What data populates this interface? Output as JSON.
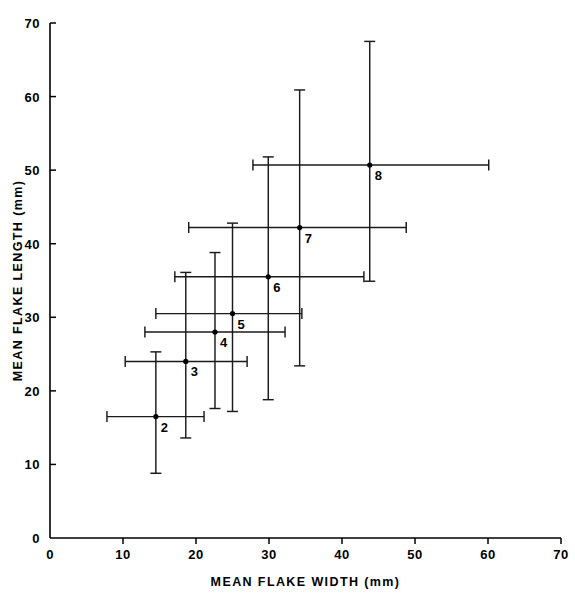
{
  "chart_data": {
    "type": "scatter",
    "title": "",
    "xlabel": "MEAN FLAKE WIDTH (mm)",
    "ylabel": "MEAN FLAKE LENGTH (mm)",
    "xlim": [
      0,
      70
    ],
    "ylim": [
      0,
      70
    ],
    "xticks": [
      0,
      10,
      20,
      30,
      40,
      50,
      60,
      70
    ],
    "yticks": [
      0,
      10,
      20,
      30,
      40,
      50,
      60,
      70
    ],
    "xtick_labels": [
      "0",
      "10",
      "20",
      "30",
      "40",
      "50",
      "60",
      "70"
    ],
    "ytick_labels": [
      "0",
      "10",
      "20",
      "30",
      "40",
      "50",
      "60",
      "70"
    ],
    "grid": false,
    "legend": false,
    "error_bars": "both",
    "marker_color": "#000000",
    "line_color": "#1a1a1a",
    "points": [
      {
        "label": "2",
        "x": 14.5,
        "y": 16.5,
        "x_low": 7.8,
        "x_high": 21.1,
        "y_low": 8.8,
        "y_high": 25.3
      },
      {
        "label": "3",
        "x": 18.6,
        "y": 24.0,
        "x_low": 10.3,
        "x_high": 27.0,
        "y_low": 13.6,
        "y_high": 36.1
      },
      {
        "label": "4",
        "x": 22.6,
        "y": 28.0,
        "x_low": 13.0,
        "x_high": 32.2,
        "y_low": 17.6,
        "y_high": 38.8
      },
      {
        "label": "5",
        "x": 25.0,
        "y": 30.5,
        "x_low": 14.5,
        "x_high": 34.5,
        "y_low": 17.2,
        "y_high": 42.8
      },
      {
        "label": "6",
        "x": 29.9,
        "y": 35.5,
        "x_low": 17.1,
        "x_high": 43.0,
        "y_low": 18.8,
        "y_high": 51.8
      },
      {
        "label": "7",
        "x": 34.2,
        "y": 42.2,
        "x_low": 19.0,
        "x_high": 48.8,
        "y_low": 23.4,
        "y_high": 60.9
      },
      {
        "label": "8",
        "x": 43.8,
        "y": 50.7,
        "x_low": 27.8,
        "x_high": 60.1,
        "y_low": 34.9,
        "y_high": 67.5
      }
    ]
  }
}
